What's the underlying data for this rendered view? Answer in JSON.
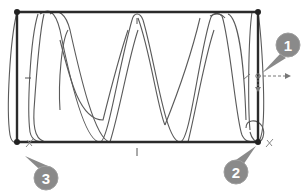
{
  "diagram": {
    "type": "cad-sketch-helical-sweep",
    "colors": {
      "sketch_line": "#2b2b2b",
      "curve_line": "#555555",
      "callout_fill": "#8a8a8a",
      "constraint_marker": "#777777"
    },
    "rectangle": {
      "x1": 17,
      "y1": 12,
      "x2": 258,
      "y2": 142
    },
    "callouts": [
      {
        "label": "1",
        "cx": 288,
        "cy": 45
      },
      {
        "label": "2",
        "cx": 236,
        "cy": 172
      },
      {
        "label": "3",
        "cx": 46,
        "cy": 178
      }
    ]
  }
}
